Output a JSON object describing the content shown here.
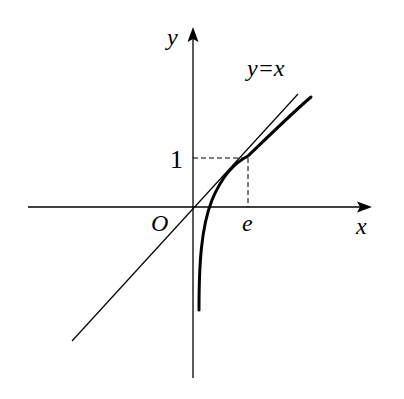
{
  "diagram": {
    "type": "function-graph",
    "axes": {
      "x_label": "x",
      "y_label": "y",
      "origin_label": "O"
    },
    "line": {
      "label": "y=x"
    },
    "curve": {
      "function": "y = ln x"
    },
    "marked_point": {
      "x_tick_label": "e",
      "y_tick_label": "1"
    },
    "colors": {
      "stroke": "#000000",
      "background": "#ffffff"
    }
  }
}
